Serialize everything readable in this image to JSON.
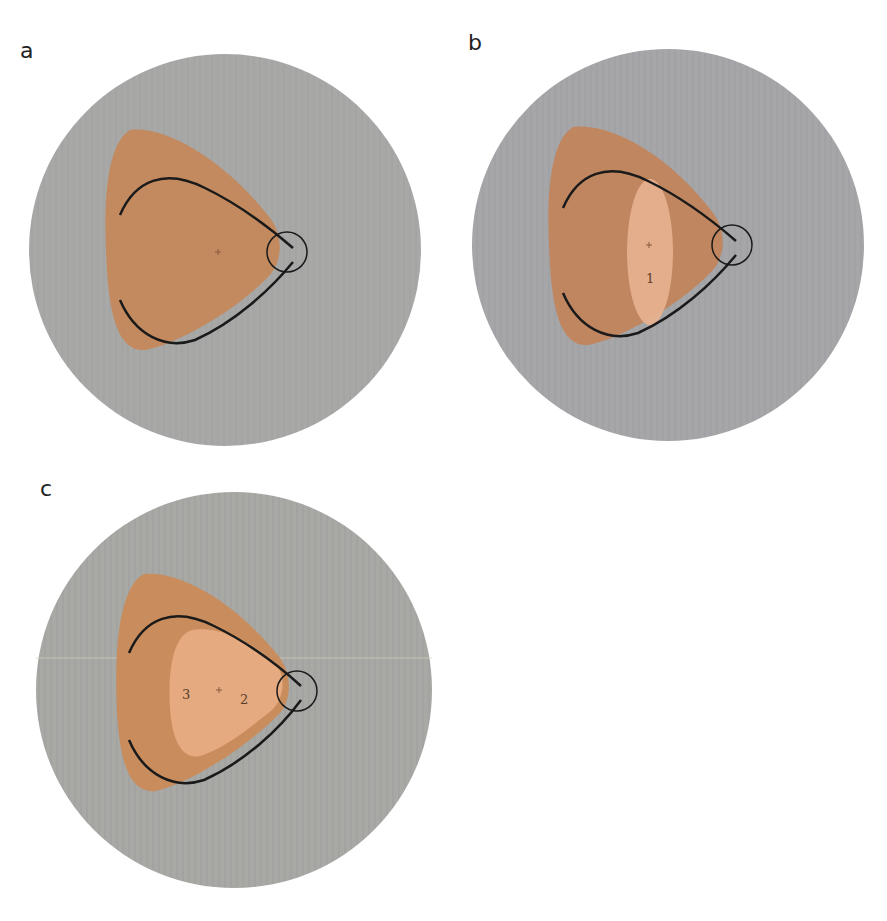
{
  "colors": {
    "field": "#a7a7a5",
    "scotoma_dark": "#c48a5f",
    "scotoma_light": "#e8b08a",
    "curve": "#1a1a1a",
    "disc_outline": "#1a1a1a"
  },
  "panels": [
    {
      "id": "a",
      "label": "a",
      "region_labels": []
    },
    {
      "id": "b",
      "label": "b",
      "region_labels": [
        "1"
      ]
    },
    {
      "id": "c",
      "label": "c",
      "region_labels": [
        "3",
        "2"
      ]
    }
  ]
}
